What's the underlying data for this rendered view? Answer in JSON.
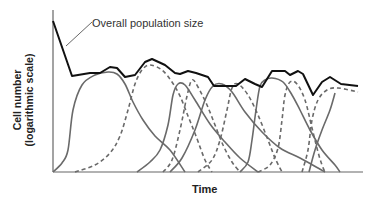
{
  "chart_data": {
    "type": "line",
    "title": "",
    "xlabel": "Time",
    "ylabel": "Cell number (logarithmic scale)",
    "ylabel_lines": [
      "Cell number",
      "(logarithmic scale)"
    ],
    "grid": false,
    "legend": null,
    "annotations": [
      {
        "text": "Overall population size",
        "points_to": "overall-population-curve"
      }
    ],
    "series": [
      {
        "name": "Overall population size",
        "style": "solid-black",
        "points": [
          [
            53,
            21
          ],
          [
            72,
            76
          ],
          [
            90,
            73
          ],
          [
            100,
            73
          ],
          [
            110,
            67
          ],
          [
            117,
            68
          ],
          [
            125,
            77
          ],
          [
            135,
            75
          ],
          [
            145,
            62
          ],
          [
            152,
            59
          ],
          [
            165,
            65
          ],
          [
            175,
            73
          ],
          [
            180,
            74
          ],
          [
            188,
            71
          ],
          [
            196,
            73
          ],
          [
            208,
            77
          ],
          [
            214,
            86
          ],
          [
            228,
            86
          ],
          [
            236,
            86
          ],
          [
            245,
            79
          ],
          [
            255,
            84
          ],
          [
            262,
            87
          ],
          [
            272,
            71
          ],
          [
            285,
            71
          ],
          [
            290,
            75
          ],
          [
            298,
            71
          ],
          [
            303,
            74
          ],
          [
            313,
            95
          ],
          [
            322,
            82
          ],
          [
            330,
            77
          ],
          [
            341,
            84
          ],
          [
            358,
            86
          ]
        ]
      },
      {
        "name": "Subpopulation 1",
        "style": "solid-gray",
        "points": [
          [
            53,
            172
          ],
          [
            62,
            163
          ],
          [
            68,
            150
          ],
          [
            73,
            110
          ],
          [
            82,
            85
          ],
          [
            95,
            75
          ],
          [
            108,
            72
          ],
          [
            117,
            74
          ],
          [
            125,
            84
          ],
          [
            133,
            102
          ],
          [
            143,
            120
          ],
          [
            155,
            136
          ],
          [
            170,
            150
          ],
          [
            185,
            172
          ]
        ]
      },
      {
        "name": "Subpopulation 2",
        "style": "dashed-gray",
        "points": [
          [
            75,
            172
          ],
          [
            95,
            165
          ],
          [
            110,
            153
          ],
          [
            120,
            136
          ],
          [
            128,
            110
          ],
          [
            135,
            84
          ],
          [
            142,
            70
          ],
          [
            150,
            65
          ],
          [
            162,
            70
          ],
          [
            172,
            82
          ],
          [
            180,
            96
          ],
          [
            188,
            116
          ],
          [
            196,
            136
          ],
          [
            205,
            160
          ],
          [
            212,
            172
          ]
        ]
      },
      {
        "name": "Subpopulation 3",
        "style": "solid-gray",
        "points": [
          [
            137,
            172
          ],
          [
            150,
            162
          ],
          [
            160,
            150
          ],
          [
            168,
            125
          ],
          [
            173,
            95
          ],
          [
            178,
            84
          ],
          [
            185,
            85
          ],
          [
            195,
            100
          ],
          [
            210,
            124
          ],
          [
            225,
            142
          ],
          [
            240,
            158
          ],
          [
            258,
            172
          ]
        ]
      },
      {
        "name": "Subpopulation 4",
        "style": "dashed-gray",
        "points": [
          [
            163,
            172
          ],
          [
            172,
            160
          ],
          [
            180,
            130
          ],
          [
            187,
            96
          ],
          [
            192,
            80
          ],
          [
            198,
            87
          ],
          [
            207,
            105
          ],
          [
            215,
            125
          ],
          [
            223,
            145
          ],
          [
            232,
            162
          ],
          [
            240,
            172
          ]
        ]
      },
      {
        "name": "Subpopulation 5",
        "style": "solid-gray",
        "points": [
          [
            170,
            172
          ],
          [
            182,
            158
          ],
          [
            195,
            130
          ],
          [
            205,
            100
          ],
          [
            213,
            86
          ],
          [
            222,
            84
          ],
          [
            232,
            92
          ],
          [
            245,
            112
          ],
          [
            262,
            132
          ],
          [
            280,
            148
          ],
          [
            300,
            158
          ],
          [
            318,
            168
          ],
          [
            325,
            172
          ]
        ]
      },
      {
        "name": "Subpopulation 6",
        "style": "dashed-gray",
        "points": [
          [
            198,
            172
          ],
          [
            212,
            160
          ],
          [
            220,
            140
          ],
          [
            227,
            110
          ],
          [
            232,
            88
          ],
          [
            238,
            84
          ],
          [
            248,
            95
          ],
          [
            258,
            115
          ],
          [
            268,
            140
          ],
          [
            275,
            158
          ],
          [
            282,
            172
          ]
        ]
      },
      {
        "name": "Subpopulation 7",
        "style": "solid-gray",
        "points": [
          [
            240,
            172
          ],
          [
            248,
            162
          ],
          [
            252,
            140
          ],
          [
            256,
            110
          ],
          [
            260,
            86
          ],
          [
            265,
            80
          ],
          [
            272,
            78
          ],
          [
            283,
            82
          ],
          [
            292,
            95
          ],
          [
            300,
            110
          ],
          [
            310,
            130
          ],
          [
            322,
            150
          ],
          [
            335,
            165
          ],
          [
            340,
            172
          ]
        ]
      },
      {
        "name": "Subpopulation 8",
        "style": "dashed-gray",
        "points": [
          [
            258,
            172
          ],
          [
            270,
            165
          ],
          [
            278,
            148
          ],
          [
            282,
            120
          ],
          [
            285,
            95
          ],
          [
            290,
            82
          ],
          [
            297,
            84
          ],
          [
            305,
            100
          ],
          [
            312,
            128
          ],
          [
            318,
            152
          ],
          [
            322,
            165
          ],
          [
            325,
            172
          ]
        ]
      },
      {
        "name": "Subpopulation 9",
        "style": "dashed-gray",
        "points": [
          [
            302,
            172
          ],
          [
            308,
            150
          ],
          [
            312,
            120
          ],
          [
            318,
            100
          ],
          [
            327,
            90
          ],
          [
            338,
            88
          ],
          [
            358,
            92
          ]
        ]
      },
      {
        "name": "Subpopulation 10",
        "style": "solid-gray",
        "points": [
          [
            309,
            172
          ],
          [
            315,
            150
          ],
          [
            322,
            130
          ],
          [
            330,
            110
          ],
          [
            335,
            93
          ]
        ]
      }
    ],
    "axes": {
      "origin": [
        53,
        172
      ],
      "x_end": 363,
      "y_top": 10
    }
  }
}
